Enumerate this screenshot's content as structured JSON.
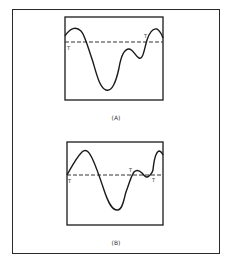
{
  "figure": {
    "panels": [
      {
        "id": "A",
        "label": "(A)",
        "threshold_label": "T",
        "crossing_labels": [
          "T",
          "T"
        ]
      },
      {
        "id": "B",
        "label": "(B)",
        "threshold_label": "T",
        "crossing_labels": [
          "T",
          "T",
          "T"
        ]
      }
    ],
    "colors": {
      "line": "#1a1a1a",
      "dashed_threshold": "#333333",
      "background": "#ffffff"
    }
  }
}
